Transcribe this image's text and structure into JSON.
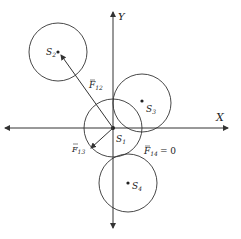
{
  "diagram": {
    "axes": {
      "x_label": "X",
      "y_label": "Y"
    },
    "spheres": [
      {
        "id": "S1",
        "label": "S",
        "sub": "1"
      },
      {
        "id": "S2",
        "label": "S",
        "sub": "2"
      },
      {
        "id": "S3",
        "label": "S",
        "sub": "3"
      },
      {
        "id": "S4",
        "label": "S",
        "sub": "4"
      }
    ],
    "forces": [
      {
        "id": "F12",
        "label": "F",
        "sub": "12"
      },
      {
        "id": "F13",
        "label": "F",
        "sub": "13"
      },
      {
        "id": "F14",
        "label": "F",
        "sub": "14",
        "value": "= 0"
      }
    ],
    "colors": {
      "stroke": "#333333",
      "background": "#ffffff"
    }
  }
}
